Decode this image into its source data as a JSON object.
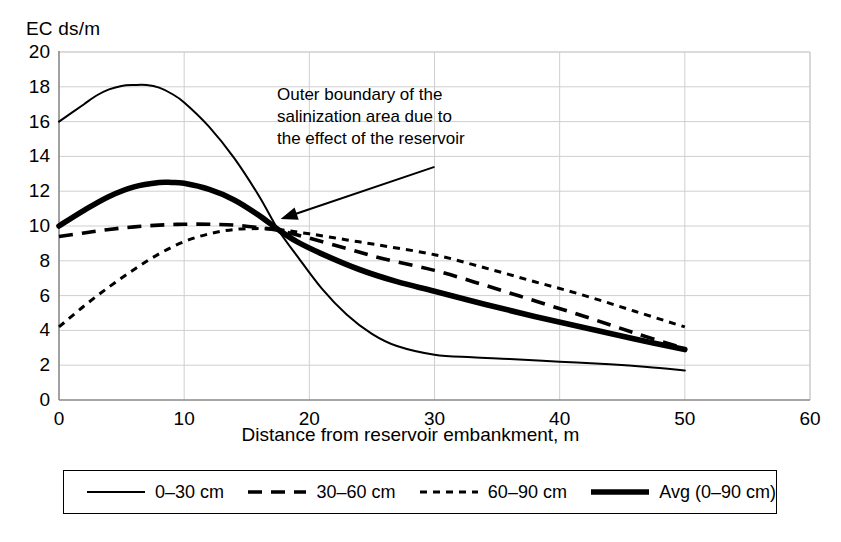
{
  "chart_data": {
    "type": "line",
    "title": "",
    "xlabel": "Distance from reservoir embankment, m",
    "ylabel": "EC ds/m",
    "xlim": [
      0,
      60
    ],
    "ylim": [
      0,
      20
    ],
    "xticks": [
      "0",
      "10",
      "20",
      "30",
      "40",
      "50",
      "60"
    ],
    "yticks": [
      "0",
      "2",
      "4",
      "6",
      "8",
      "10",
      "12",
      "14",
      "16",
      "18",
      "20"
    ],
    "grid": true,
    "legend_position": "below-plot",
    "annotations": [
      {
        "name": "outer-boundary-annotation",
        "lines": [
          "Outer boundary of the",
          "salinization area due to",
          "the effect of the reservoir"
        ],
        "arrow_from_x": 30.0,
        "arrow_from_y": 13.4,
        "arrow_to_x": 17.7,
        "arrow_to_y": 10.4
      }
    ],
    "series": [
      {
        "name": "0–30 cm",
        "style": "thin-solid",
        "color": "#000000",
        "x": [
          0,
          1,
          2,
          3,
          4,
          5,
          6,
          7,
          8,
          9,
          10,
          12,
          14,
          16,
          17.5,
          19,
          21,
          23,
          25,
          27,
          30,
          33,
          36,
          40,
          44,
          47,
          50
        ],
        "y": [
          16.0,
          16.5,
          17.0,
          17.5,
          17.85,
          18.05,
          18.1,
          18.1,
          17.95,
          17.6,
          17.1,
          15.7,
          13.9,
          11.7,
          9.8,
          8.3,
          6.4,
          4.9,
          3.8,
          3.1,
          2.6,
          2.45,
          2.35,
          2.2,
          2.05,
          1.9,
          1.7
        ]
      },
      {
        "name": "30–60 cm",
        "style": "dashed",
        "color": "#000000",
        "x": [
          0,
          2,
          4,
          6,
          8,
          10,
          12,
          14,
          16,
          17.5,
          20,
          23,
          26,
          30,
          34,
          38,
          42,
          46,
          50
        ],
        "y": [
          9.4,
          9.6,
          9.8,
          9.95,
          10.05,
          10.1,
          10.1,
          10.05,
          9.9,
          9.75,
          9.3,
          8.7,
          8.1,
          7.45,
          6.6,
          5.7,
          4.8,
          3.85,
          2.95
        ]
      },
      {
        "name": "60–90 cm",
        "style": "dotted",
        "color": "#000000",
        "x": [
          0,
          2,
          4,
          6,
          8,
          10,
          12,
          14,
          16,
          17.5,
          20,
          23,
          26,
          30,
          34,
          38,
          42,
          46,
          50
        ],
        "y": [
          4.2,
          5.4,
          6.5,
          7.5,
          8.4,
          9.1,
          9.55,
          9.8,
          9.85,
          9.8,
          9.55,
          9.2,
          8.85,
          8.35,
          7.6,
          6.8,
          6.0,
          5.1,
          4.2
        ]
      },
      {
        "name": "Avg (0–90 cm)",
        "style": "thick-solid",
        "color": "#000000",
        "x": [
          0,
          2,
          4,
          6,
          8,
          9,
          10,
          12,
          14,
          16,
          17.5,
          19,
          21,
          24,
          27,
          30,
          34,
          38,
          42,
          46,
          50
        ],
        "y": [
          10.0,
          10.9,
          11.7,
          12.25,
          12.5,
          12.5,
          12.45,
          12.1,
          11.5,
          10.6,
          9.8,
          9.1,
          8.4,
          7.5,
          6.8,
          6.25,
          5.5,
          4.8,
          4.15,
          3.5,
          2.9
        ]
      }
    ],
    "legend": [
      {
        "label": "0–30 cm",
        "style": "thin-solid"
      },
      {
        "label": "30–60 cm",
        "style": "dashed"
      },
      {
        "label": "60–90 cm",
        "style": "dotted"
      },
      {
        "label": "Avg (0–90 cm)",
        "style": "thick-solid"
      }
    ]
  },
  "colors": {
    "grid": "#cfcfcf",
    "axis": "#8a8a8a",
    "series": "#000000",
    "background": "#ffffff"
  }
}
